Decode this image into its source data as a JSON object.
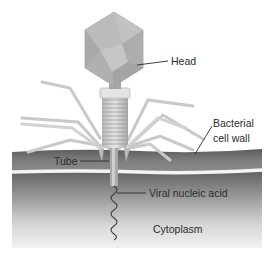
{
  "labels": {
    "head": "Head",
    "wall_line1": "Bacterial",
    "wall_line2": "cell wall",
    "tube": "Tube",
    "nucleic_acid": "Viral nucleic acid",
    "cytoplasm": "Cytoplasm"
  },
  "colors": {
    "capsid": "#b4b4b4",
    "cell_wall": "#7d7d7d",
    "membrane_line": "#f2f2f2",
    "cytoplasm_top": "#6a6a6a",
    "cytoplasm_bottom": "#f0f0f0",
    "fiber": "#cfcfcf",
    "label_text": "#2b2b2b"
  }
}
